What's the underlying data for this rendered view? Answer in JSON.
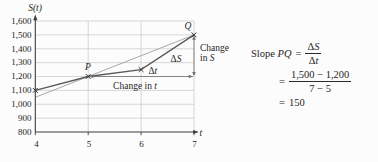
{
  "chart_data": {
    "type": "line",
    "title": "",
    "xlabel": "t",
    "ylabel": "S(t)",
    "xlim": [
      4,
      7
    ],
    "ylim": [
      800,
      1600
    ],
    "grid": true,
    "x_ticks": [
      {
        "v": 4,
        "label": "4"
      },
      {
        "v": 5,
        "label": "5"
      },
      {
        "v": 6,
        "label": "6"
      },
      {
        "v": 7,
        "label": "7"
      }
    ],
    "y_ticks": [
      {
        "v": 800,
        "label": "800"
      },
      {
        "v": 900,
        "label": "900"
      },
      {
        "v": 1000,
        "label": "1,000"
      },
      {
        "v": 1100,
        "label": "1,100"
      },
      {
        "v": 1200,
        "label": "1,200"
      },
      {
        "v": 1300,
        "label": "1,300"
      },
      {
        "v": 1400,
        "label": "1,400"
      },
      {
        "v": 1500,
        "label": "1,500"
      },
      {
        "v": 1600,
        "label": "1,600"
      }
    ],
    "series": [
      {
        "name": "graph of S(t)",
        "points": [
          [
            4,
            1100
          ],
          [
            5,
            1200
          ],
          [
            6,
            1250
          ],
          [
            7,
            1500
          ]
        ],
        "marker": "x",
        "color": "#5a5a5a",
        "width": 1.3
      },
      {
        "name": "secant line PQ",
        "points": [
          [
            4,
            1050
          ],
          [
            7,
            1500
          ]
        ],
        "marker": "none",
        "color": "#a9a9a9",
        "width": 1
      }
    ],
    "points_of_interest": [
      {
        "label": "P",
        "t": 5,
        "s": 1200
      },
      {
        "label": "Q",
        "t": 7,
        "s": 1500
      }
    ],
    "measurements": {
      "delta_t": {
        "symbol_prefix": "Δ",
        "symbol_var": "t",
        "caption_prefix": "Change in ",
        "caption_var": "t",
        "from_t": 5,
        "to_t": 7,
        "at_s": 1200
      },
      "delta_s": {
        "symbol_prefix": "Δ",
        "symbol_var": "S",
        "caption_line1": "Change",
        "caption_line2_prefix": "in ",
        "caption_line2_var": "S",
        "from_s": 1200,
        "to_s": 1500,
        "at_t": 7
      }
    },
    "colors": {
      "grid": "#cdcdcd",
      "axis": "#3c3c3c",
      "marker": "#2f2f2f",
      "measure": "#707070"
    }
  },
  "formula": {
    "slope_label": "Slope ",
    "slope_var": "PQ",
    "equals": "=",
    "frac_symbolic": {
      "num_prefix": "Δ",
      "num_var": "S",
      "den_prefix": "Δ",
      "den_var": "t"
    },
    "frac_numeric": {
      "num": "1,500 − 1,200",
      "den": "7 − 5"
    },
    "result": "150"
  }
}
